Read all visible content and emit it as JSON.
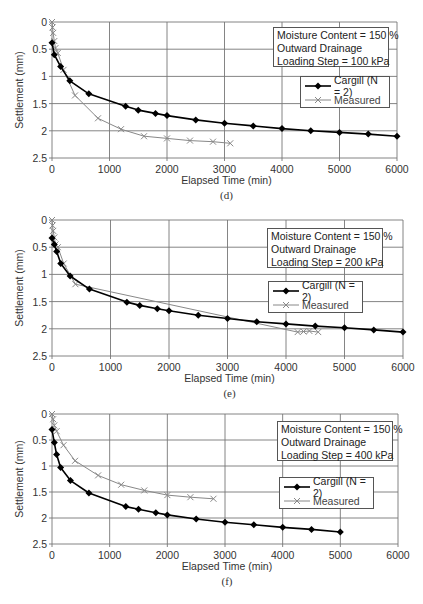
{
  "chart_data": [
    {
      "type": "line",
      "panel_label": "(d)",
      "title": "",
      "xlabel": "Elapsed Time (min)",
      "ylabel": "Settlement (mm)",
      "xlim": [
        0,
        6000
      ],
      "ylim": [
        0,
        2.5
      ],
      "y_inverted": true,
      "x_ticks": [
        "0",
        "1000",
        "2000",
        "3000",
        "4000",
        "5000",
        "6000"
      ],
      "y_ticks": [
        "0",
        "0.5",
        "1",
        "1.5",
        "2",
        "2.5"
      ],
      "grid": true,
      "annotation": [
        "Moisture Content = 150 %",
        "Outward  Drainage",
        "Loading Step = 100 kPa"
      ],
      "legend": [
        "Cargill (N = 2)",
        "Measured"
      ],
      "series": [
        {
          "name": "Cargill (N = 2)",
          "marker": "diamond",
          "color": "#000000",
          "x": [
            0,
            40,
            150,
            310,
            640,
            1280,
            1500,
            1800,
            2000,
            2500,
            3000,
            3500,
            4000,
            4500,
            5000,
            5500,
            6000
          ],
          "y": [
            0.38,
            0.6,
            0.82,
            1.08,
            1.32,
            1.55,
            1.62,
            1.68,
            1.72,
            1.8,
            1.86,
            1.91,
            1.96,
            2.0,
            2.03,
            2.06,
            2.1
          ]
        },
        {
          "name": "Measured",
          "marker": "x",
          "color": "#888888",
          "x": [
            0,
            10,
            20,
            40,
            60,
            100,
            200,
            400,
            800,
            1200,
            1600,
            2000,
            2400,
            2800,
            3100
          ],
          "y": [
            0.0,
            0.1,
            0.2,
            0.35,
            0.48,
            0.57,
            0.88,
            1.35,
            1.77,
            1.97,
            2.1,
            2.14,
            2.18,
            2.2,
            2.23
          ]
        }
      ]
    },
    {
      "type": "line",
      "panel_label": "(e)",
      "title": "",
      "xlabel": "Elapsed Time (min)",
      "ylabel": "Settlement (mm)",
      "xlim": [
        0,
        6000
      ],
      "ylim": [
        0,
        2.5
      ],
      "y_inverted": true,
      "x_ticks": [
        "0",
        "1000",
        "2000",
        "3000",
        "4000",
        "5000",
        "6000"
      ],
      "y_ticks": [
        "0",
        "0.5",
        "1",
        "1.5",
        "2",
        "2.5"
      ],
      "grid": true,
      "annotation": [
        "Moisture Content = 150 %",
        "Outward  Drainage",
        "Loading Step = 200 kPa"
      ],
      "legend": [
        "Cargill (N = 2)",
        "Measured"
      ],
      "series": [
        {
          "name": "Cargill (N = 2)",
          "marker": "diamond",
          "color": "#000000",
          "x": [
            0,
            40,
            80,
            150,
            310,
            640,
            1280,
            1500,
            1800,
            2000,
            2500,
            3000,
            3500,
            4000,
            4500,
            5000,
            5500,
            6000
          ],
          "y": [
            0.33,
            0.45,
            0.58,
            0.8,
            1.03,
            1.27,
            1.51,
            1.57,
            1.63,
            1.67,
            1.75,
            1.81,
            1.87,
            1.91,
            1.95,
            1.98,
            2.02,
            2.06
          ]
        },
        {
          "name": "Measured",
          "marker": "x",
          "color": "#888888",
          "x": [
            0,
            10,
            20,
            40,
            60,
            100,
            200,
            400,
            4200,
            4300,
            4400,
            4550
          ],
          "y": [
            0.0,
            0.1,
            0.2,
            0.32,
            0.45,
            0.5,
            0.8,
            1.18,
            2.06,
            2.05,
            2.04,
            2.06
          ]
        }
      ]
    },
    {
      "type": "line",
      "panel_label": "(f)",
      "title": "",
      "xlabel": "Elapsed Time (min)",
      "ylabel": "Settlement (mm)",
      "xlim": [
        0,
        6000
      ],
      "ylim": [
        0,
        2.5
      ],
      "y_inverted": true,
      "x_ticks": [
        "0",
        "1000",
        "2000",
        "3000",
        "4000",
        "5000",
        "6000"
      ],
      "y_ticks": [
        "0",
        "0.5",
        "1",
        "1.5",
        "2",
        "2.5"
      ],
      "grid": true,
      "annotation": [
        "Moisture Content = 150 %",
        "Outward  Drainage",
        "Loading Step = 400 kPa"
      ],
      "legend": [
        "Cargill (N = 2)",
        "Measured"
      ],
      "series": [
        {
          "name": "Cargill (N = 2)",
          "marker": "diamond",
          "color": "#000000",
          "x": [
            0,
            40,
            80,
            150,
            320,
            640,
            1280,
            1500,
            1800,
            2000,
            2500,
            3000,
            3500,
            4000,
            4500,
            5000
          ],
          "y": [
            0.3,
            0.55,
            0.78,
            1.03,
            1.28,
            1.52,
            1.78,
            1.83,
            1.9,
            1.94,
            2.02,
            2.08,
            2.13,
            2.18,
            2.22,
            2.27
          ]
        },
        {
          "name": "Measured",
          "marker": "x",
          "color": "#888888",
          "x": [
            0,
            20,
            40,
            80,
            200,
            400,
            800,
            1200,
            1600,
            2000,
            2400,
            2800
          ],
          "y": [
            0.0,
            0.1,
            0.22,
            0.33,
            0.6,
            0.9,
            1.18,
            1.36,
            1.47,
            1.56,
            1.6,
            1.63
          ]
        }
      ]
    }
  ],
  "panels": [
    {
      "caption": "(d)",
      "xlabel": "Elapsed Time (min)",
      "ylabel": "Settlement (mm)",
      "info": {
        "line1": "Moisture Content = 150 %",
        "line2": "Outward  Drainage",
        "line3": "Loading Step = 100 kPa"
      },
      "legend": {
        "cargill": "Cargill (N = 2)",
        "measured": "Measured"
      }
    },
    {
      "caption": "(e)",
      "xlabel": "Elapsed Time (min)",
      "ylabel": "Settlement (mm)",
      "info": {
        "line1": "Moisture Content = 150 %",
        "line2": "Outward  Drainage",
        "line3": "Loading Step = 200 kPa"
      },
      "legend": {
        "cargill": "Cargill (N = 2)",
        "measured": "Measured"
      }
    },
    {
      "caption": "(f)",
      "xlabel": "Elapsed Time (min)",
      "ylabel": "Settlement (mm)",
      "info": {
        "line1": "Moisture Content = 150 %",
        "line2": "Outward  Drainage",
        "line3": "Loading Step = 400 kPa"
      },
      "legend": {
        "cargill": "Cargill (N = 2)",
        "measured": "Measured"
      }
    }
  ],
  "layout": {
    "plots": [
      {
        "left": 52,
        "right": 397,
        "top": 22,
        "bottom": 158,
        "info": [
          273,
          27,
          116,
          40
        ],
        "leg": [
          300,
          76,
          90,
          32
        ],
        "xlabelY": 184,
        "capY": 199
      },
      {
        "left": 52,
        "right": 403,
        "top": 220,
        "bottom": 356,
        "info": [
          267,
          228,
          116,
          40
        ],
        "leg": [
          268,
          281,
          95,
          32
        ],
        "xlabelY": 382,
        "capY": 397
      },
      {
        "left": 52,
        "right": 398,
        "top": 414,
        "bottom": 544,
        "info": [
          277,
          421,
          116,
          40
        ],
        "leg": [
          279,
          477,
          95,
          32
        ],
        "xlabelY": 570,
        "capY": 585
      }
    ]
  }
}
